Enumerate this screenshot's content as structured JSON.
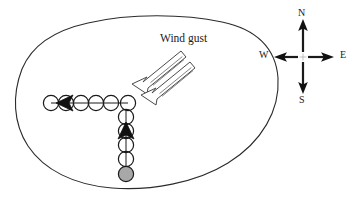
{
  "figure": {
    "title": "",
    "region_outline": {
      "name": "region-boundary",
      "stroke_color": "#2b2b2b",
      "stroke_width": 1.1,
      "fill": "none"
    },
    "annotations": {
      "wind_gust_label": "Wind gust"
    },
    "wind_arrows": {
      "count": 2,
      "direction": "down-left",
      "stroke_color": "#4a4a4a",
      "fill": "#ffffff",
      "shaft_stripes": 3
    },
    "horizontal_track": {
      "name": "westward-track",
      "direction": "west",
      "circle_count": 6,
      "circle_radius": 7.6,
      "circle_fill": "none",
      "circle_stroke": "#1a1a1a",
      "arrowhead_index": 1,
      "arrowhead_direction": "left",
      "start_x": 51,
      "end_x": 128,
      "y": 103
    },
    "vertical_track": {
      "name": "northward-track",
      "direction": "north",
      "circle_count": 6,
      "circle_radius": 7.6,
      "circle_fill": "none",
      "circle_stroke": "#1a1a1a",
      "arrowhead_index": 2,
      "arrowhead_direction": "up",
      "x": 126,
      "start_y": 103,
      "end_y": 174,
      "terminal_circle_fill": "#a8a8a8",
      "terminal_circle_index": 5
    },
    "compass": {
      "name": "compass-rose",
      "center_x": 303,
      "center_y": 57,
      "arm_length": 33,
      "arrow_color": "#1a1a1a",
      "labels": {
        "north": "N",
        "south": "S",
        "east": "E",
        "west": "W"
      }
    },
    "colors": {
      "ink": "#1a1a1a",
      "outline": "#2b2b2b",
      "gray_fill": "#a8a8a8",
      "arrow_outline": "#4a4a4a",
      "background": "#ffffff"
    }
  }
}
